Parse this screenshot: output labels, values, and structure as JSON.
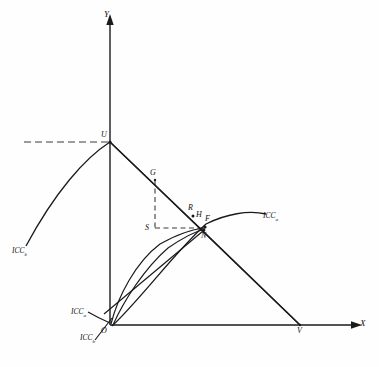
{
  "figure": {
    "background_color": "#fefefe",
    "stroke_color": "#1a1a1a",
    "dash_color": "#3a3a3a",
    "axes": {
      "y_label": "Y",
      "x_label": "X",
      "origin_label": "O"
    },
    "points": [
      {
        "id": "U",
        "label": "U",
        "x": 110,
        "y": 142
      },
      {
        "id": "G",
        "label": "G",
        "x": 155,
        "y": 178
      },
      {
        "id": "S",
        "label": "S",
        "x": 155,
        "y": 228
      },
      {
        "id": "R",
        "label": "R",
        "x": 192,
        "y": 211
      },
      {
        "id": "H",
        "label": "H",
        "x": 199,
        "y": 216
      },
      {
        "id": "F",
        "label": "F",
        "x": 206,
        "y": 220
      },
      {
        "id": "N",
        "label": "N",
        "x": 204,
        "y": 231
      },
      {
        "id": "V",
        "label": "V",
        "x": 300,
        "y": 325
      },
      {
        "id": "O",
        "label": "O",
        "x": 110,
        "y": 325
      }
    ],
    "curve_labels": [
      {
        "id": "icc-b-upper-left",
        "base": "ICC",
        "sub": "b",
        "x": 12,
        "y": 250
      },
      {
        "id": "icc-a-right",
        "base": "ICC",
        "sub": "a",
        "x": 263,
        "y": 215
      },
      {
        "id": "icc-a-origin",
        "base": "ICC",
        "sub": "a",
        "x": 72,
        "y": 310
      },
      {
        "id": "icc-b-origin",
        "base": "ICC",
        "sub": "b",
        "x": 80,
        "y": 336
      }
    ],
    "elements": {
      "y_axis": "vertical-axis-with-up-arrow",
      "x_axis": "horizontal-axis-with-right-arrow",
      "dashed_horizontal_to_U": "dashed guide from left margin to point U",
      "dashed_G_to_S": "dashed vertical segment G down to S",
      "dashed_S_to_F": "dashed horizontal segment S right to F",
      "line_U_to_V": "straight budget line from U through G, R to V",
      "line_U_to_ICCb": "curve from U down-left to ICC b label",
      "line_V_to_O": "straight line from V up-left through N toward origin region",
      "curve_O_to_ICCa": "concave curve from origin through F continuing right to ICC a",
      "curve_O_inner": "inner curve from origin rising to F region",
      "line_U_to_N": "straight segment from U down-right to N"
    }
  }
}
